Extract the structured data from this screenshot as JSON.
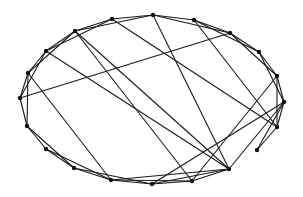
{
  "diagram": {
    "type": "graph",
    "layout": "ellipse",
    "edge_color": "#1a1a1a",
    "node_color": "#111111",
    "node_radius": 2.2,
    "nodes": [
      {
        "id": 0,
        "x": 153,
        "y": 15
      },
      {
        "id": 1,
        "x": 194,
        "y": 20
      },
      {
        "id": 2,
        "x": 230,
        "y": 33
      },
      {
        "id": 3,
        "x": 259,
        "y": 52
      },
      {
        "id": 4,
        "x": 277,
        "y": 76
      },
      {
        "id": 5,
        "x": 284,
        "y": 102
      },
      {
        "id": 6,
        "x": 277,
        "y": 127
      },
      {
        "id": 7,
        "x": 257,
        "y": 150
      },
      {
        "id": 8,
        "x": 229,
        "y": 169
      },
      {
        "id": 9,
        "x": 192,
        "y": 181
      },
      {
        "id": 10,
        "x": 152,
        "y": 184
      },
      {
        "id": 11,
        "x": 111,
        "y": 180
      },
      {
        "id": 12,
        "x": 74,
        "y": 168
      },
      {
        "id": 13,
        "x": 46,
        "y": 149
      },
      {
        "id": 14,
        "x": 27,
        "y": 126
      },
      {
        "id": 15,
        "x": 20,
        "y": 98
      },
      {
        "id": 16,
        "x": 28,
        "y": 73
      },
      {
        "id": 17,
        "x": 46,
        "y": 51
      },
      {
        "id": 18,
        "x": 75,
        "y": 31
      },
      {
        "id": 19,
        "x": 112,
        "y": 19
      }
    ],
    "edges": [
      [
        0,
        1
      ],
      [
        1,
        2
      ],
      [
        2,
        3
      ],
      [
        3,
        4
      ],
      [
        4,
        5
      ],
      [
        5,
        6
      ],
      [
        6,
        7
      ],
      [
        8,
        9
      ],
      [
        9,
        10
      ],
      [
        10,
        11
      ],
      [
        11,
        12
      ],
      [
        12,
        13
      ],
      [
        13,
        14
      ],
      [
        14,
        15
      ],
      [
        15,
        16
      ],
      [
        16,
        17
      ],
      [
        17,
        18
      ],
      [
        18,
        19
      ],
      [
        19,
        0
      ],
      [
        0,
        2
      ],
      [
        1,
        3
      ],
      [
        2,
        4
      ],
      [
        3,
        5
      ],
      [
        4,
        6
      ],
      [
        5,
        7
      ],
      [
        8,
        10
      ],
      [
        9,
        11
      ],
      [
        10,
        12
      ],
      [
        11,
        13
      ],
      [
        12,
        14
      ],
      [
        14,
        16
      ],
      [
        15,
        17
      ],
      [
        16,
        18
      ],
      [
        17,
        19
      ],
      [
        18,
        0
      ],
      [
        19,
        6
      ],
      [
        18,
        8
      ],
      [
        18,
        9
      ],
      [
        17,
        8
      ],
      [
        15,
        2
      ],
      [
        16,
        11
      ],
      [
        10,
        5
      ],
      [
        1,
        6
      ],
      [
        0,
        8
      ],
      [
        8,
        5
      ],
      [
        11,
        8
      ],
      [
        9,
        4
      ]
    ]
  }
}
